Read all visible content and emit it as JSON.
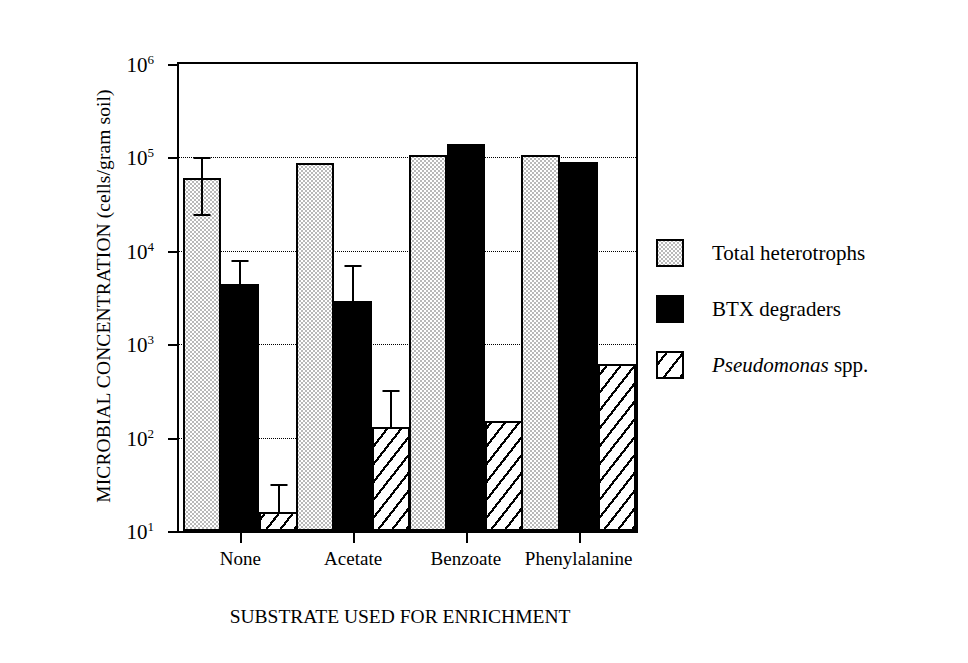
{
  "chart_data": {
    "type": "bar",
    "title": "",
    "xlabel": "SUBSTRATE USED FOR ENRICHMENT",
    "ylabel": "MICROBIAL CONCENTRATION (cells/gram soil)",
    "yscale": "log",
    "ylim": [
      10,
      1000000
    ],
    "grid": "horizontal-dotted",
    "legend_position": "right",
    "categories": [
      "None",
      "Acetate",
      "Benzoate",
      "Phenylalanine"
    ],
    "ytick_labels": [
      "10",
      "10",
      "10",
      "10",
      "10",
      "10"
    ],
    "ytick_exponents": [
      "6",
      "5",
      "4",
      "3",
      "2",
      "1"
    ],
    "ytick_values": [
      1000000,
      100000,
      10000,
      1000,
      100,
      10
    ],
    "series": [
      {
        "name": "Total heterotrophs",
        "key": "total",
        "fill": "stippled-gray",
        "color": "#b9b9b9",
        "values": [
          60000,
          88000,
          105000,
          105000
        ],
        "err_low": [
          25000,
          null,
          null,
          null
        ],
        "err_high": [
          100000,
          null,
          null,
          null
        ]
      },
      {
        "name": "BTX degraders",
        "key": "btx",
        "fill": "solid-black",
        "color": "#000000",
        "values": [
          4400,
          2900,
          140000,
          90000
        ],
        "err_low": [
          null,
          null,
          null,
          null
        ],
        "err_high": [
          8000,
          7000,
          null,
          null
        ]
      },
      {
        "name": "Pseudomonas spp.",
        "key": "pseudo",
        "fill": "diagonal-hatch",
        "color": "#ffffff",
        "values": [
          16,
          130,
          150,
          620
        ],
        "err_low": [
          null,
          null,
          null,
          null
        ],
        "err_high": [
          32,
          320,
          null,
          null
        ]
      }
    ],
    "legend": [
      {
        "label": "Total heterotrophs",
        "italic_prefix": "",
        "key": "total"
      },
      {
        "label": "BTX degraders",
        "italic_prefix": "",
        "key": "btx"
      },
      {
        "label": " spp.",
        "italic_prefix": "Pseudomonas",
        "key": "pseudo"
      }
    ]
  }
}
